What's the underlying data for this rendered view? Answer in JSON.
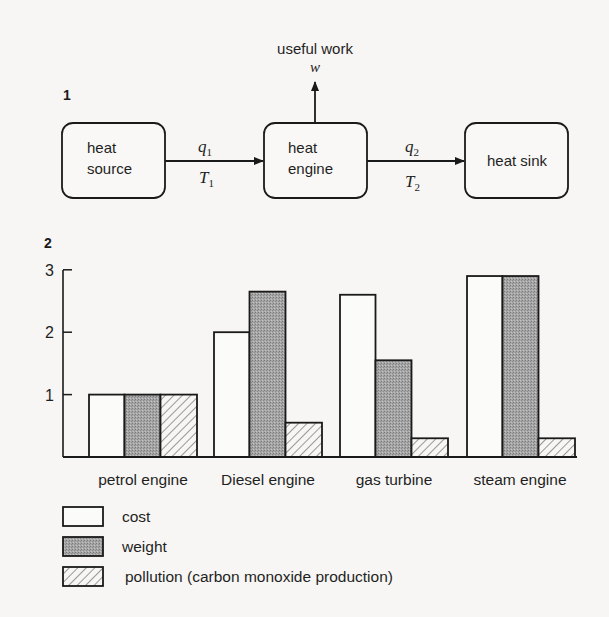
{
  "figure1": {
    "number": "1",
    "nodes": [
      {
        "id": "source",
        "lines": [
          "heat",
          "source"
        ]
      },
      {
        "id": "engine",
        "lines": [
          "heat",
          "engine"
        ]
      },
      {
        "id": "sink",
        "lines": [
          "heat sink"
        ]
      }
    ],
    "flows": {
      "in": {
        "quantity": "q",
        "q_sub": "1",
        "temp": "T",
        "t_sub": "1"
      },
      "out": {
        "quantity": "q",
        "q_sub": "2",
        "temp": "T",
        "t_sub": "2"
      }
    },
    "work": {
      "label": "useful work",
      "symbol": "w"
    }
  },
  "figure2": {
    "number": "2"
  },
  "chart_data": {
    "type": "bar",
    "title": "",
    "xlabel": "",
    "ylabel": "",
    "ylim": [
      0,
      3
    ],
    "yticks": [
      1,
      2,
      3
    ],
    "grid": false,
    "legend_position": "bottom-left",
    "categories": [
      "petrol engine",
      "Diesel engine",
      "gas turbine",
      "steam engine"
    ],
    "series": [
      {
        "name": "cost",
        "fill": "plain",
        "values": [
          1.0,
          2.0,
          2.6,
          2.9
        ]
      },
      {
        "name": "weight",
        "fill": "stippled",
        "values": [
          1.0,
          2.65,
          1.55,
          2.9
        ]
      },
      {
        "name": "pollution (carbon monoxide production)",
        "fill": "hatched",
        "values": [
          1.0,
          0.55,
          0.3,
          0.3
        ]
      }
    ]
  },
  "legend": {
    "items": [
      {
        "label": "cost",
        "fill": "plain"
      },
      {
        "label": "weight",
        "fill": "stippled"
      },
      {
        "label": "pollution (carbon monoxide production)",
        "fill": "hatched"
      }
    ]
  },
  "colors": {
    "ink": "#1a1a1a",
    "paper": "#f7f6f4",
    "plain_fill": "#fbfbfa",
    "stipple_fill": "#9d9d9d"
  }
}
